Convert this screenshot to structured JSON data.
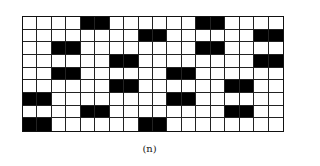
{
  "figure": {
    "caption": "(n)",
    "grid": {
      "rows": 9,
      "cols": 18,
      "filled_color": "#000000",
      "empty_color": "#ffffff",
      "filled": [
        [
          4,
          5,
          12,
          13
        ],
        [
          8,
          9,
          16,
          17
        ],
        [
          2,
          3,
          12,
          13
        ],
        [
          6,
          7,
          16,
          17
        ],
        [
          2,
          3,
          10,
          11
        ],
        [
          6,
          7,
          14,
          15
        ],
        [
          0,
          1,
          10,
          11
        ],
        [
          4,
          5,
          14,
          15
        ],
        [
          0,
          1,
          8,
          9
        ]
      ]
    }
  }
}
